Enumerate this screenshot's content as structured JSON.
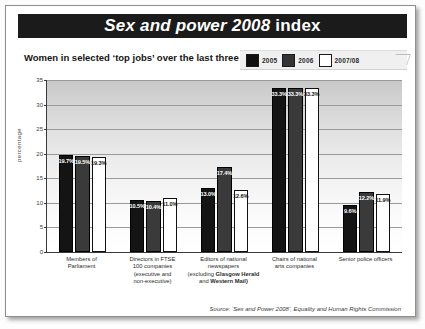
{
  "title": {
    "emphasis": "Sex and power 2008",
    "plain": " index"
  },
  "subtitle": "Women in selected ‘top jobs’ over the last three years.",
  "legend": {
    "position": "top-right",
    "entries": [
      {
        "label": "2005",
        "color": "#101010"
      },
      {
        "label": "2006",
        "color": "#343434"
      },
      {
        "label": "2007/08",
        "color": "#ffffff"
      }
    ]
  },
  "source": "Source: ‘Sex and Power 2008’, Equality and Human Rights Commission",
  "chart_data": {
    "type": "bar",
    "title": "Sex and power 2008 index",
    "subtitle": "Women in selected ‘top jobs’ over the last three years.",
    "xlabel": "",
    "ylabel": "percentage",
    "ylim": [
      0,
      35
    ],
    "yticks": [
      0,
      5,
      10,
      15,
      20,
      25,
      30,
      35
    ],
    "ytick_labels": [
      "0",
      "5",
      "10",
      "15",
      "20",
      "25",
      "30",
      "35"
    ],
    "grid": true,
    "legend_position": "top-right",
    "categories": [
      "Members of Parliament",
      "Directors in FTSE 100 companies (executive and non-executive)",
      "Editors of national newspapers (excluding Glasgow Herald and Western Mail)",
      "Chairs of national arts companies",
      "Senior police officers"
    ],
    "category_lines": [
      [
        {
          "text": "Members of",
          "bold": false
        },
        {
          "text": "Parliament",
          "bold": false
        }
      ],
      [
        {
          "text": "Directors in FTSE",
          "bold": false
        },
        {
          "text": "100 companies",
          "bold": false
        },
        {
          "text": "(executive and",
          "bold": false
        },
        {
          "text": "non-executive)",
          "bold": false
        }
      ],
      [
        {
          "text": "Editors of national newspapers",
          "bold": false
        },
        {
          "text": "(excluding ",
          "bold": false
        },
        {
          "text": "Glasgow Herald",
          "bold": true
        },
        {
          "text": "and ",
          "bold": false
        },
        {
          "text": "Western Mail)",
          "bold": true
        }
      ],
      [
        {
          "text": "Chairs of national",
          "bold": false
        },
        {
          "text": "arts companies",
          "bold": false
        }
      ],
      [
        {
          "text": "Senior police officers",
          "bold": false
        }
      ]
    ],
    "series": [
      {
        "name": "2005",
        "color": "#141414",
        "values": [
          19.7,
          10.5,
          13.0,
          33.3,
          9.6
        ],
        "labels": [
          "19.7%",
          "10.5%",
          "13.0%",
          "33.3%",
          "9.6%"
        ]
      },
      {
        "name": "2006",
        "color": "#3a3a3a",
        "values": [
          19.5,
          10.4,
          17.4,
          33.3,
          12.2
        ],
        "labels": [
          "19.5%",
          "10.4%",
          "17.4%",
          "33.3%",
          "12.2%"
        ]
      },
      {
        "name": "2007/08",
        "color": "#ffffff",
        "values": [
          19.3,
          11.0,
          12.6,
          33.3,
          11.9
        ],
        "labels": [
          "19.3%",
          "11.0%",
          "12.6%",
          "33.3%",
          "11.9%"
        ]
      }
    ]
  }
}
